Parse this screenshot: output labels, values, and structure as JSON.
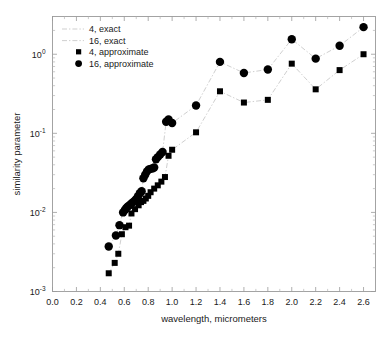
{
  "chart_data": {
    "type": "scatter",
    "title": "",
    "xlabel": "wavelength, micrometers",
    "ylabel": "similarity parameter",
    "xlim": [
      0.0,
      2.7
    ],
    "ylim": [
      0.001,
      3.0
    ],
    "yscale": "log",
    "xscale": "linear",
    "grid": false,
    "legend_position": "top-left",
    "xticks": [
      "0.0",
      "0.2",
      "0.4",
      "0.6",
      "0.8",
      "1.0",
      "1.2",
      "1.4",
      "1.6",
      "1.8",
      "2.0",
      "2.2",
      "2.4",
      "2.6"
    ],
    "xtick_values": [
      0.0,
      0.2,
      0.4,
      0.6,
      0.8,
      1.0,
      1.2,
      1.4,
      1.6,
      1.8,
      2.0,
      2.2,
      2.4,
      2.6
    ],
    "ytick_labels": [
      "10",
      "10",
      "10",
      "10"
    ],
    "ytick_exponents": [
      "0",
      "-1",
      "-2",
      "-3"
    ],
    "ytick_values": [
      1.0,
      0.1,
      0.01,
      0.001
    ],
    "legend": [
      {
        "key": "4-exact",
        "label": "4, exact",
        "style": "dashdot-line",
        "color": "#c9c9c9"
      },
      {
        "key": "16-exact",
        "label": "16, exact",
        "style": "dashdot-line",
        "color": "#c9c9c9"
      },
      {
        "key": "4-approximate",
        "label": "4, approximate",
        "style": "small-square",
        "color": "#000000"
      },
      {
        "key": "16-approximate",
        "label": "16, approximate",
        "style": "large-circle",
        "color": "#000000"
      }
    ],
    "series": [
      {
        "name": "4, approximate",
        "marker": "square",
        "marker_size": 3.0,
        "line": "dashdot",
        "x": [
          0.47,
          0.52,
          0.55,
          0.58,
          0.61,
          0.64,
          0.66,
          0.69,
          0.72,
          0.74,
          0.76,
          0.78,
          0.8,
          0.82,
          0.85,
          0.88,
          0.91,
          0.94,
          0.97,
          1.0,
          1.2,
          1.4,
          1.6,
          1.8,
          2.0,
          2.2,
          2.4,
          2.6
        ],
        "y": [
          0.0017,
          0.0023,
          0.003,
          0.0053,
          0.0065,
          0.0068,
          0.0097,
          0.011,
          0.0123,
          0.0135,
          0.014,
          0.015,
          0.0162,
          0.018,
          0.02,
          0.022,
          0.0245,
          0.028,
          0.052,
          0.062,
          0.103,
          0.34,
          0.245,
          0.265,
          0.76,
          0.36,
          0.63,
          1.0
        ]
      },
      {
        "name": "16, approximate",
        "marker": "circle",
        "marker_size": 4.2,
        "line": "dashdot",
        "x": [
          0.47,
          0.53,
          0.56,
          0.59,
          0.605,
          0.615,
          0.625,
          0.64,
          0.655,
          0.67,
          0.685,
          0.7,
          0.715,
          0.73,
          0.745,
          0.76,
          0.775,
          0.79,
          0.805,
          0.82,
          0.835,
          0.85,
          0.865,
          0.88,
          0.9,
          0.92,
          0.95,
          0.97,
          1.0,
          1.2,
          1.4,
          1.6,
          1.8,
          2.0,
          2.2,
          2.4,
          2.6
        ],
        "y": [
          0.0037,
          0.0051,
          0.0069,
          0.01,
          0.0107,
          0.0112,
          0.0117,
          0.0122,
          0.0128,
          0.0134,
          0.014,
          0.0148,
          0.016,
          0.0175,
          0.0185,
          0.027,
          0.03,
          0.033,
          0.035,
          0.0355,
          0.036,
          0.037,
          0.047,
          0.05,
          0.054,
          0.058,
          0.14,
          0.15,
          0.135,
          0.225,
          0.8,
          0.58,
          0.64,
          1.55,
          0.88,
          1.28,
          2.2
        ]
      }
    ]
  }
}
